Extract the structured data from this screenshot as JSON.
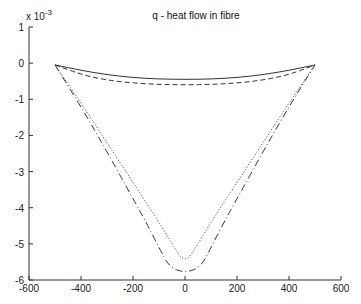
{
  "chart_data": {
    "type": "line",
    "title": "q - heat flow in fibre",
    "xlabel": "",
    "ylabel": "",
    "y_multiplier_label": "x 10",
    "y_multiplier_exponent": "-3",
    "xlim": [
      -600,
      600
    ],
    "ylim": [
      -6,
      1
    ],
    "xticks": [
      -600,
      -400,
      -200,
      0,
      200,
      400,
      600
    ],
    "xtick_labels": [
      "-600",
      "-400",
      "-200",
      "0",
      "200",
      "400",
      "600"
    ],
    "yticks": [
      1,
      0,
      -1,
      -2,
      -3,
      -4,
      -5,
      -6
    ],
    "ytick_labels": [
      "1",
      "0",
      "-1",
      "-2",
      "-3",
      "-4",
      "-5",
      "-6"
    ],
    "grid": false,
    "legend": null,
    "series": [
      {
        "name": "solid",
        "style": "solid",
        "x": [
          -500,
          -400,
          -300,
          -200,
          -100,
          0,
          100,
          200,
          300,
          400,
          500
        ],
        "y": [
          -0.05,
          -0.2,
          -0.32,
          -0.4,
          -0.44,
          -0.45,
          -0.44,
          -0.4,
          -0.32,
          -0.2,
          -0.05
        ]
      },
      {
        "name": "dashed",
        "style": "dashed",
        "x": [
          -500,
          -400,
          -300,
          -200,
          -100,
          0,
          100,
          200,
          300,
          400,
          500
        ],
        "y": [
          -0.05,
          -0.32,
          -0.47,
          -0.55,
          -0.59,
          -0.6,
          -0.59,
          -0.55,
          -0.47,
          -0.32,
          -0.05
        ]
      },
      {
        "name": "dotted",
        "style": "dotted",
        "x": [
          -500,
          -400,
          -300,
          -200,
          -100,
          -50,
          0,
          50,
          100,
          200,
          300,
          400,
          500
        ],
        "y": [
          -0.05,
          -1.1,
          -2.2,
          -3.3,
          -4.4,
          -5.0,
          -5.55,
          -5.0,
          -4.4,
          -3.3,
          -2.2,
          -1.1,
          -0.05
        ]
      },
      {
        "name": "dash-dot",
        "style": "dashdot",
        "x": [
          -500,
          -400,
          -300,
          -200,
          -150,
          -100,
          -60,
          0,
          60,
          100,
          150,
          200,
          300,
          400,
          500
        ],
        "y": [
          -0.05,
          -1.2,
          -2.45,
          -3.75,
          -4.4,
          -5.1,
          -5.65,
          -5.8,
          -5.65,
          -5.1,
          -4.4,
          -3.75,
          -2.45,
          -1.2,
          -0.05
        ]
      }
    ]
  },
  "colors": {
    "axes": "#333333",
    "lines": "#333333",
    "background": "#ffffff"
  }
}
